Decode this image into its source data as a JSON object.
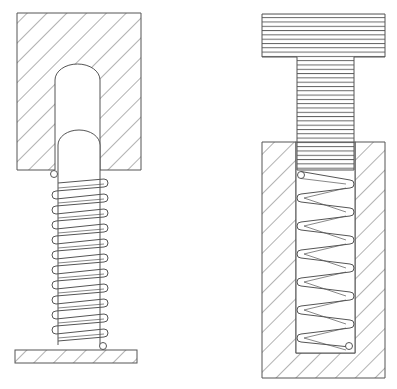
{
  "diagram": {
    "title": "",
    "colors": {
      "stroke": "#555555",
      "hatch": "#666666",
      "background": "#ffffff"
    },
    "figures": [
      {
        "id": "left",
        "description": "Extension spring attached between hatched upper block with rounded cavity/plunger and hatched base plate"
      },
      {
        "id": "right",
        "description": "Compression spring inside hatched housing bore pressed by horizontally-ruled T-shaped plunger"
      }
    ]
  }
}
